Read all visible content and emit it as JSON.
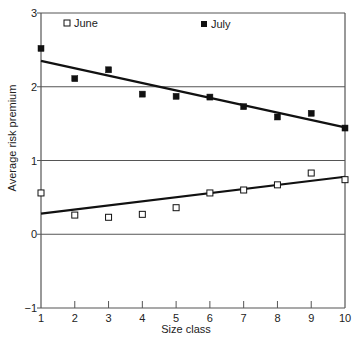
{
  "chart_data": {
    "type": "scatter",
    "title": "",
    "xlabel": "Size class",
    "ylabel": "Average risk premium",
    "xlim": [
      1,
      10
    ],
    "ylim": [
      -1,
      3
    ],
    "x_ticks": [
      1,
      2,
      3,
      4,
      5,
      6,
      7,
      8,
      9,
      10
    ],
    "y_ticks": [
      -1,
      0,
      1,
      2,
      3
    ],
    "y_tick_labels": [
      "−1",
      "0",
      "1",
      "2",
      "3"
    ],
    "grid": {
      "horizontal": [
        0,
        1,
        2,
        3
      ],
      "vertical": false
    },
    "legend_position": "top-inside",
    "x": [
      1,
      2,
      3,
      4,
      5,
      6,
      7,
      8,
      9,
      10
    ],
    "series": [
      {
        "name": "June",
        "marker": "open-square",
        "values": [
          0.56,
          0.26,
          0.23,
          0.27,
          0.36,
          0.56,
          0.6,
          0.67,
          0.83,
          0.74
        ],
        "trendline": {
          "x": [
            1,
            10
          ],
          "y": [
            0.28,
            0.78
          ]
        }
      },
      {
        "name": "July",
        "marker": "filled-square",
        "values": [
          2.52,
          2.11,
          2.23,
          1.9,
          1.87,
          1.86,
          1.73,
          1.59,
          1.64,
          1.44
        ],
        "trendline": {
          "x": [
            1,
            10
          ],
          "y": [
            2.35,
            1.45
          ]
        }
      }
    ]
  },
  "labels": {
    "xlabel": "Size class",
    "ylabel": "Average risk premium",
    "legend_june": "June",
    "legend_july": "July"
  },
  "colors": {
    "line": "#111111",
    "grid": "#555555",
    "frame": "#555555"
  }
}
